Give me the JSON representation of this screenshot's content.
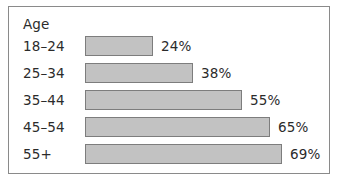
{
  "figure": {
    "background_color": "#ffffff",
    "frame_border_color": "#8a8a8a",
    "bar_fill_color": "#c2c2c2",
    "bar_border_color": "#7d7d7d",
    "text_color": "#2b2b2b"
  },
  "chart_data": {
    "type": "bar",
    "orientation": "horizontal",
    "title": "Age",
    "xlabel": "",
    "ylabel": "",
    "grid": false,
    "legend": null,
    "xlim": [
      0,
      100
    ],
    "value_suffix": "%",
    "categories": [
      "18–24",
      "25–34",
      "35–44",
      "45–54",
      "55+"
    ],
    "values": [
      24,
      38,
      55,
      65,
      69
    ],
    "value_labels": [
      "24%",
      "38%",
      "55%",
      "65%",
      "69%"
    ],
    "rows": [
      {
        "category": "18–24",
        "value": 24,
        "label": "24%"
      },
      {
        "category": "25–34",
        "value": 38,
        "label": "38%"
      },
      {
        "category": "35–44",
        "value": 55,
        "label": "55%"
      },
      {
        "category": "45–54",
        "value": 65,
        "label": "65%"
      },
      {
        "category": "55+",
        "value": 69,
        "label": "69%"
      }
    ]
  }
}
